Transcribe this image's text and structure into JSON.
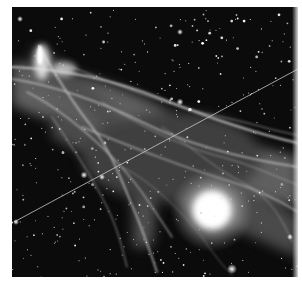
{
  "image": {
    "subject": "supernova remnant nebula with bright foreground star",
    "description": "Grayscale astronomical photograph: wispy filamentary nebula crossing the frame from upper-left to lower-right, dense star field, a large bright star in the lower right, and a thin diagonal satellite streak from lower-left to upper-right.",
    "tone": "grayscale",
    "colors": {
      "background": "#ffffff",
      "sky": "#0a0a0a",
      "nebula": "#c8c8c8",
      "star": "#ffffff"
    }
  }
}
